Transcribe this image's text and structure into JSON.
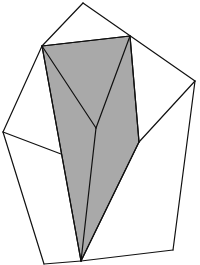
{
  "figure": {
    "type": "geometric-net-diagram",
    "width": 200,
    "height": 265,
    "colors": {
      "background": "#ffffff",
      "stroke": "#111111",
      "shade": "#a9a9a9"
    },
    "vertices": {
      "top_apex": [
        83,
        3
      ],
      "shaded_top_left": [
        42,
        46
      ],
      "shaded_top_right": [
        130,
        36
      ],
      "right_vertex": [
        195,
        81
      ],
      "left_vertex": [
        3,
        132
      ],
      "inner_junction": [
        96,
        128
      ],
      "shaded_right_bottom": [
        139,
        142
      ],
      "shaded_left_mid": [
        61,
        154
      ],
      "bottom_tip": [
        81,
        261
      ],
      "bottom_left": [
        44,
        264
      ],
      "bottom_right": [
        173,
        250
      ]
    },
    "shaded_region": {
      "label": "shaded quadrilateral",
      "points": "42,46 130,36 139,142 81,261"
    },
    "outline_segments": [
      {
        "name": "top-left-upper-edge",
        "points": "83,3 42,46"
      },
      {
        "name": "top-right-upper-edge",
        "points": "83,3 195,81"
      },
      {
        "name": "shaded-top-edge",
        "points": "42,46 130,36"
      },
      {
        "name": "upper-left-outer-edge",
        "points": "42,46 3,132"
      },
      {
        "name": "left-flap-inner-edge",
        "points": "3,132 61,154"
      },
      {
        "name": "lower-left-outer-edge",
        "points": "3,132 44,264"
      },
      {
        "name": "bottom-left-edge",
        "points": "44,264 81,261"
      },
      {
        "name": "bottom-right-edge",
        "points": "81,261 173,250"
      },
      {
        "name": "right-outer-edge",
        "points": "195,81 173,250"
      },
      {
        "name": "right-flap-inner-edge",
        "points": "195,81 139,142"
      },
      {
        "name": "shaded-left-edge",
        "points": "42,46 81,261"
      },
      {
        "name": "shaded-right-edge",
        "points": "130,36 139,142"
      },
      {
        "name": "shaded-lower-right-edge",
        "points": "139,142 81,261"
      },
      {
        "name": "fold-left-diagonal",
        "points": "42,46 96,128"
      },
      {
        "name": "fold-right-diagonal",
        "points": "130,36 96,128"
      },
      {
        "name": "fold-center-stem",
        "points": "96,128 81,261"
      }
    ]
  }
}
